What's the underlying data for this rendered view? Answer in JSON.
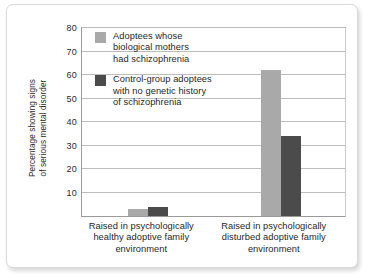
{
  "chart_data": {
    "type": "bar",
    "title": "",
    "subtitle": "",
    "xlabel": "",
    "ylabel": "Percentage showing signs of serious mental disorder",
    "ylabel_line1": "Percentage showing signs",
    "ylabel_line2": "of serious mental disorder",
    "ylim": [
      0,
      80
    ],
    "yticks": [
      10,
      20,
      30,
      40,
      50,
      60,
      70,
      80
    ],
    "ytick_labels": [
      "10",
      "20",
      "30",
      "40",
      "50",
      "60",
      "70",
      "80"
    ],
    "grid": true,
    "legend_position": "inside-upper-left",
    "categories": [
      "Raised in psychologically healthy adoptive family environment",
      "Raised in psychologically disturbed adoptive family environment"
    ],
    "category_lines": [
      [
        "Raised in psychologically",
        "healthy adoptive family",
        "environment"
      ],
      [
        "Raised in psychologically",
        "disturbed adoptive family",
        "environment"
      ]
    ],
    "series": [
      {
        "name": "Adoptees whose biological mothers had schizophrenia",
        "name_lines": [
          "Adoptees whose",
          "biological mothers",
          "had schizophrenia"
        ],
        "color": "#a9a9a9",
        "values": [
          3,
          62
        ]
      },
      {
        "name": "Control-group adoptees with no genetic history of schizophrenia",
        "name_lines": [
          "Control-group adoptees",
          "with no genetic history",
          "of schizophrenia"
        ],
        "color": "#4b4b4b",
        "values": [
          4,
          34
        ]
      }
    ]
  },
  "colors": {
    "series_light": "#a9a9a9",
    "series_dark": "#4b4b4b",
    "gridline": "#bdbdbd",
    "axis": "#9a9a9a",
    "text": "#1f1f1f",
    "background": "#ffffff",
    "card_border": "#d9d9d9"
  }
}
